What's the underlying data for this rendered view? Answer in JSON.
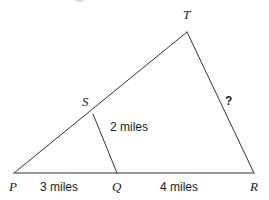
{
  "figure": {
    "kind": "geometry-diagram",
    "stroke_color": "#333333",
    "background_color": "#ffffff",
    "text_color": "#1c1c1c",
    "stroke_width": 1,
    "width": 269,
    "height": 200,
    "points": {
      "P": {
        "label": "P",
        "x": 14,
        "y": 173,
        "label_x": 9,
        "label_y": 180
      },
      "Q": {
        "label": "Q",
        "x": 117,
        "y": 173,
        "label_x": 112,
        "label_y": 180
      },
      "R": {
        "label": "R",
        "x": 254,
        "y": 173,
        "label_x": 250,
        "label_y": 180
      },
      "S": {
        "label": "S",
        "x": 93,
        "y": 114,
        "label_x": 82,
        "label_y": 95
      },
      "T": {
        "label": "T",
        "x": 187,
        "y": 32,
        "label_x": 183,
        "label_y": 8
      }
    },
    "segments": [
      {
        "name": "base-PR",
        "from": "P",
        "to": "R"
      },
      {
        "name": "side-PT",
        "from": "P",
        "to": "T"
      },
      {
        "name": "side-TR",
        "from": "T",
        "to": "R"
      },
      {
        "name": "segment-SQ",
        "from": "S",
        "to": "Q"
      }
    ],
    "measurements": [
      {
        "name": "PQ",
        "text": "3 miles",
        "x": 40,
        "y": 181
      },
      {
        "name": "QR",
        "text": "4 miles",
        "x": 160,
        "y": 181
      },
      {
        "name": "SQ",
        "text": "2 miles",
        "x": 110,
        "y": 121
      },
      {
        "name": "TR",
        "text": "?",
        "x": 225,
        "y": 95
      }
    ]
  }
}
